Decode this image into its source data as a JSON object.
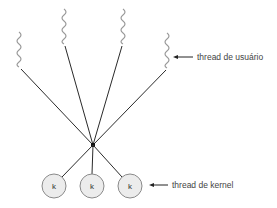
{
  "diagram": {
    "type": "many-to-one threading model",
    "user_threads": [
      {
        "id": "u1",
        "x": 19,
        "top": 32,
        "bottom": 68
      },
      {
        "id": "u2",
        "x": 64,
        "top": 9,
        "bottom": 45
      },
      {
        "id": "u3",
        "x": 123,
        "top": 9,
        "bottom": 45
      },
      {
        "id": "u4",
        "x": 167,
        "top": 33,
        "bottom": 69
      }
    ],
    "junction": {
      "x": 93,
      "y": 145
    },
    "kernel_threads": [
      {
        "id": "k1",
        "cx": 54,
        "cy": 186,
        "label": "k"
      },
      {
        "id": "k2",
        "cx": 92,
        "cy": 186,
        "label": "k"
      },
      {
        "id": "k3",
        "cx": 130,
        "cy": 186,
        "label": "k"
      }
    ],
    "labels": {
      "user_thread": "thread de usuário",
      "kernel_thread": "thread de kernel"
    },
    "colors": {
      "squiggle": "#9a9a9a",
      "line": "#2a2a2a",
      "kernel_fill": "#ececec",
      "kernel_stroke": "#8a8a8a",
      "text": "#444444"
    }
  }
}
